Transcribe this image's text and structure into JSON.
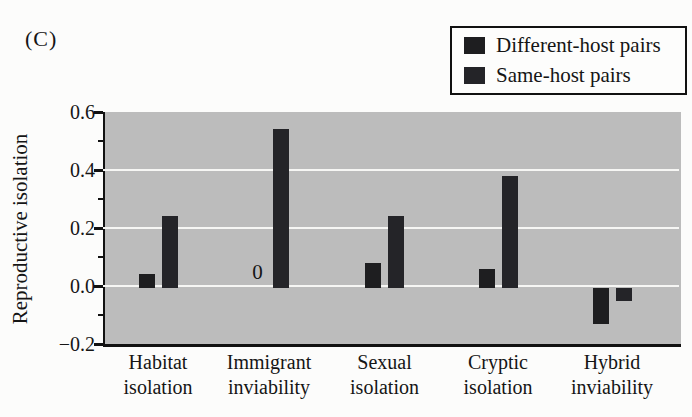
{
  "figure_label": "(C)",
  "legend": {
    "items": [
      {
        "label": "Different-host pairs"
      },
      {
        "label": "Same-host pairs"
      }
    ]
  },
  "chart_data": {
    "type": "bar",
    "title": "",
    "ylabel": "Reproductive isolation",
    "xlabel": "",
    "ylim": [
      -0.2,
      0.6
    ],
    "yticks_major": [
      0.6,
      0.4,
      0.2,
      0.0,
      -0.2
    ],
    "ytick_labels": [
      "0.6",
      "0.4",
      "0.2",
      "0.0",
      "−0.2"
    ],
    "yticks_minor": [
      0.5,
      0.3,
      0.1,
      -0.1
    ],
    "gridline_values": [
      0.4,
      0.2,
      0.0
    ],
    "grid": true,
    "legend_position": "top-right",
    "categories": [
      "Habitat isolation",
      "Immigrant inviability",
      "Sexual isolation",
      "Cryptic isolation",
      "Hybrid inviability"
    ],
    "category_label_lines": [
      [
        "Habitat",
        "isolation"
      ],
      [
        "Immigrant",
        "inviability"
      ],
      [
        "Sexual",
        "isolation"
      ],
      [
        "Cryptic",
        "isolation"
      ],
      [
        "Hybrid",
        "inviability"
      ]
    ],
    "series": [
      {
        "name": "Different-host pairs",
        "color": "#1e1e20",
        "values": [
          0.04,
          0,
          0.08,
          0.06,
          -0.13
        ]
      },
      {
        "name": "Same-host pairs",
        "color": "#242428",
        "values": [
          0.24,
          0.54,
          0.24,
          0.38,
          -0.05
        ]
      }
    ],
    "annotations": [
      {
        "text": "0",
        "series_index": 0,
        "category_index": 1
      }
    ]
  },
  "colors": {
    "plot_background": "#bcbcbc",
    "gridline": "#f6f6f4",
    "axis": "#111111",
    "text": "#151515",
    "page_background": "#fcfcfb",
    "legend_background": "#fdfdfc",
    "legend_border": "#111111"
  }
}
